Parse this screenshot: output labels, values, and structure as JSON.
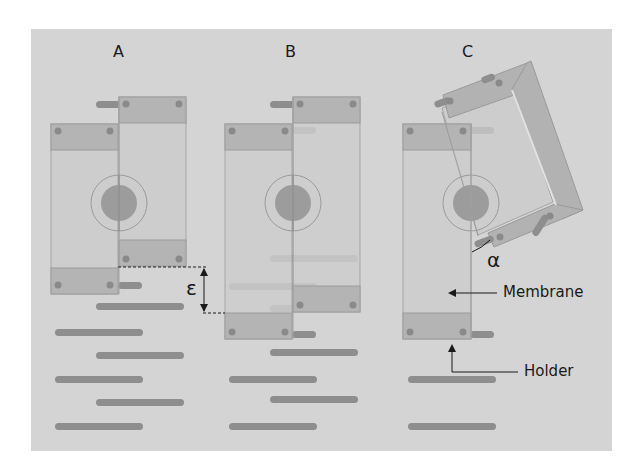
{
  "figure": {
    "background_color": "#d4d4d4",
    "panels": [
      {
        "id": "A",
        "label": "A"
      },
      {
        "id": "B",
        "label": "B"
      },
      {
        "id": "C",
        "label": "C"
      }
    ],
    "annotations": {
      "epsilon": "ε",
      "alpha": "α",
      "membrane": "Membrane",
      "holder": "Holder"
    },
    "colors": {
      "panel_bg": "#d4d4d4",
      "membrane_fill": "#cbcbcb",
      "holder_fill": "#b5b5b5",
      "rod_fill": "#8e8e8e",
      "screw_fill": "#8a8a8a",
      "circle_fill": "#9c9c9c",
      "outline": "#a0a0a0",
      "frame_fill": "#b0b0b0"
    }
  }
}
